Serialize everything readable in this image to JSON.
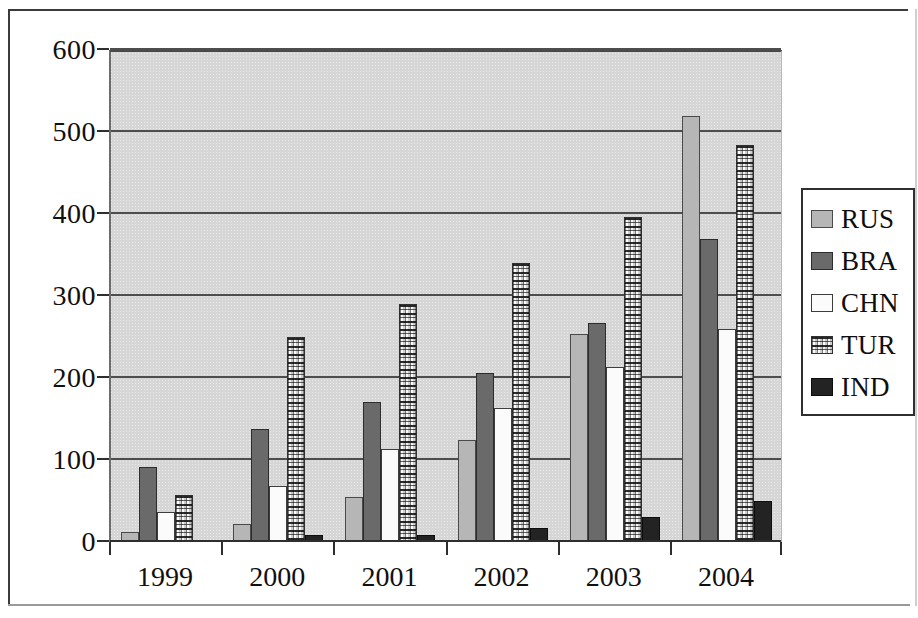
{
  "chart_data": {
    "type": "bar",
    "title": "",
    "subtitle": "",
    "xlabel": "",
    "ylabel": "",
    "categories": [
      "1999",
      "2000",
      "2001",
      "2002",
      "2003",
      "2004"
    ],
    "ylim": [
      0,
      600
    ],
    "yticks": [
      0,
      100,
      200,
      300,
      400,
      500,
      600
    ],
    "ytick_labels": [
      "0",
      "100",
      "200",
      "300",
      "400",
      "500",
      "600"
    ],
    "grid": true,
    "legend_position": "right",
    "series": [
      {
        "name": "RUS",
        "color": "#b6b6b6",
        "swatch": "light-gray-solid",
        "values": [
          12,
          22,
          55,
          124,
          254,
          520
        ]
      },
      {
        "name": "BRA",
        "color": "#6a6a6a",
        "swatch": "dark-gray-solid",
        "values": [
          92,
          138,
          171,
          206,
          267,
          370
        ]
      },
      {
        "name": "CHN",
        "color": "#fbfbfb",
        "swatch": "white-solid",
        "values": [
          36,
          68,
          113,
          163,
          214,
          260
        ]
      },
      {
        "name": "TUR",
        "color": "#ededed",
        "swatch": "hatched-pattern",
        "values": [
          57,
          250,
          290,
          340,
          396,
          484
        ]
      },
      {
        "name": "IND",
        "color": "#232323",
        "swatch": "black-solid",
        "values": [
          0,
          8,
          9,
          17,
          30,
          50
        ]
      }
    ]
  },
  "legend": {
    "items": [
      {
        "label": "RUS"
      },
      {
        "label": "BRA"
      },
      {
        "label": "CHN"
      },
      {
        "label": "TUR"
      },
      {
        "label": "IND"
      }
    ]
  }
}
